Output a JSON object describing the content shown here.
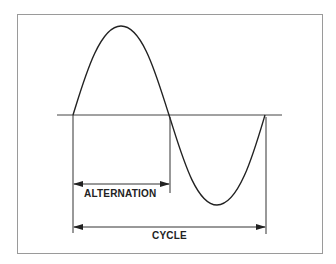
{
  "diagram": {
    "title": "",
    "type": "sine-wave-cycle",
    "labels": {
      "alternation": "ALTERNATION",
      "cycle": "CYCLE"
    },
    "colors": {
      "stroke": "#222222",
      "frame": "#9a9a9a",
      "background": "#ffffff"
    },
    "geometry": {
      "axis": {
        "x_start": 57,
        "x_end": 282,
        "y": 115
      },
      "wave": {
        "x_start": 73,
        "x_mid": 169,
        "x_end": 265,
        "peak_y": 26,
        "trough_y": 205
      },
      "alternation_arrow": {
        "x1": 73,
        "x2": 169,
        "y": 184
      },
      "cycle_arrow": {
        "x1": 73,
        "x2": 265,
        "y": 227
      }
    }
  }
}
